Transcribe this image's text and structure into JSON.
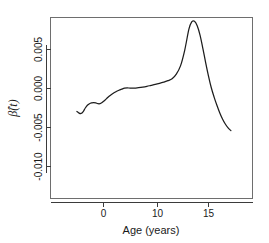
{
  "chart_data": {
    "type": "line",
    "title": "",
    "xlabel": "Age (years)",
    "ylabel": "β̂(t)",
    "ylabel_parts": {
      "symbol": "β̂",
      "arg": "(t)"
    },
    "xlim": [
      -3.8,
      18.2
    ],
    "ylim": [
      -0.0125,
      0.0092
    ],
    "xticks": [
      0,
      10,
      15
    ],
    "xtick_labels": [
      "0",
      "10",
      "15"
    ],
    "yticks": [
      0.005,
      0.0,
      -0.005,
      -0.01
    ],
    "ytick_labels": [
      "0.005",
      "0.000",
      "-0.005",
      "-0.010"
    ],
    "grid": false,
    "legend": false,
    "legend_position": "none",
    "series": [
      {
        "name": "beta-hat(t)",
        "color": "#1d1d1d",
        "x": [
          -3.8,
          -3.5,
          -3.2,
          -2.9,
          -2.6,
          -2.3,
          -2.0,
          -1.7,
          -1.4,
          -1.1,
          -0.8,
          -0.5,
          -0.2,
          0.2,
          0.6,
          1.0,
          1.4,
          1.8,
          2.2,
          2.6,
          3.0,
          3.4,
          3.8,
          4.2,
          4.6,
          5.0,
          5.6,
          6.2,
          6.8,
          7.4,
          8.0,
          8.6,
          9.2,
          9.8,
          10.4,
          11.0,
          11.6,
          12.2,
          12.6,
          13.0,
          13.4,
          13.8,
          14.2,
          14.6,
          15.0,
          15.4,
          15.8,
          16.2,
          16.6,
          17.0,
          17.4,
          17.8,
          18.2
        ],
        "y": [
          -0.00295,
          -0.00315,
          -0.0032,
          -0.00295,
          -0.0025,
          -0.00215,
          -0.00195,
          -0.00185,
          -0.0018,
          -0.00185,
          -0.00195,
          -0.00195,
          -0.0018,
          -0.0015,
          -0.00115,
          -0.00085,
          -0.0006,
          -0.0004,
          -0.00022,
          -8e-05,
          5e-05,
          8e-05,
          5e-05,
          4e-05,
          6e-05,
          0.0001,
          0.00018,
          0.00028,
          0.0004,
          0.00052,
          0.00066,
          0.00082,
          0.001,
          0.00125,
          0.00185,
          0.0029,
          0.0049,
          0.0076,
          0.00855,
          0.00862,
          0.008,
          0.0068,
          0.0051,
          0.0033,
          0.0016,
          0.0001,
          -0.0011,
          -0.00215,
          -0.0031,
          -0.0039,
          -0.00455,
          -0.00505,
          -0.0054
        ]
      }
    ]
  },
  "axes": {
    "x_axis_name": "age-axis",
    "y_axis_name": "beta-axis"
  }
}
